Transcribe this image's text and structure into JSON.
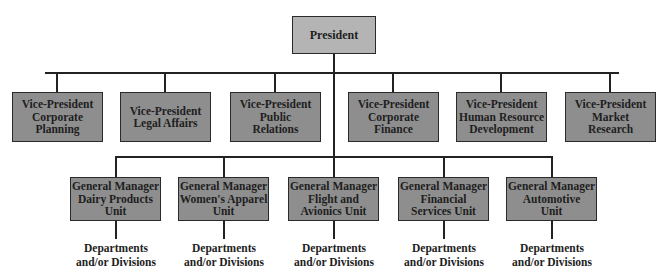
{
  "chart": {
    "root": {
      "label": "President"
    },
    "vice_presidents": [
      {
        "label": "Vice-President\nCorporate\nPlanning"
      },
      {
        "label": "Vice-President\nLegal Affairs"
      },
      {
        "label": "Vice-President\nPublic\nRelations"
      },
      {
        "label": "Vice-President\nCorporate\nFinance"
      },
      {
        "label": "Vice-President\nHuman Resource\nDevelopment"
      },
      {
        "label": "Vice-President\nMarket\nResearch"
      }
    ],
    "general_managers": [
      {
        "label": "General Manager\nDairy Products\nUnit",
        "sub": "Departments\nand/or Divisions"
      },
      {
        "label": "General Manager\nWomen's Apparel\nUnit",
        "sub": "Departments\nand/or Divisions"
      },
      {
        "label": "General Manager\nFlight and\nAvionics Unit",
        "sub": "Departments\nand/or Divisions"
      },
      {
        "label": "General Manager\nFinancial\nServices Unit",
        "sub": "Departments\nand/or Divisions"
      },
      {
        "label": "General Manager\nAutomotive\nUnit",
        "sub": "Departments\nand/or Divisions"
      }
    ]
  },
  "colors": {
    "president_fill": "#b4b4b4",
    "box_fill": "#8e8e8e",
    "line": "#222222"
  }
}
